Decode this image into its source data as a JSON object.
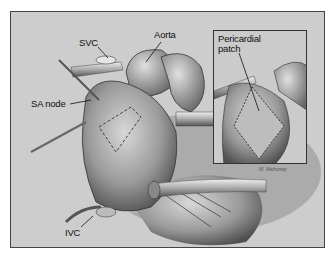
{
  "figure": {
    "type": "surgical illustration",
    "labels": {
      "aorta": "Aorta",
      "svc": "SVC",
      "sa_node": "SA node",
      "ivc": "IVC"
    },
    "inset": {
      "label_line1": "Pericardial",
      "label_line2": "patch"
    },
    "signature": "M. Mahoney",
    "colors": {
      "background": "#ffffff",
      "illustration_fill": "#cfcfcf",
      "border": "#444444",
      "text": "#111111"
    }
  }
}
